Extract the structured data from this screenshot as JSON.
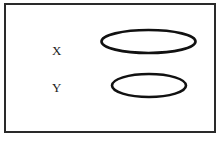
{
  "diagram": {
    "labels": {
      "x": "X",
      "y": "Y"
    },
    "shapes": [
      {
        "name": "ellipse-x",
        "cx": 148.5,
        "cy": 41.5,
        "rx": 47,
        "ry": 11.5,
        "stroke": "#111111"
      },
      {
        "name": "ellipse-y",
        "cx": 149,
        "cy": 85.5,
        "rx": 37,
        "ry": 11.5,
        "stroke": "#111111"
      }
    ],
    "frame_color": "#2a2a2a",
    "caption": ""
  }
}
